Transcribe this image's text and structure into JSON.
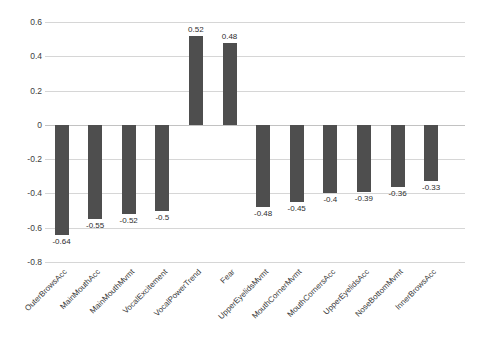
{
  "chart_data": {
    "type": "bar",
    "title": "",
    "subtitle": "",
    "xlabel": "",
    "ylabel": "",
    "ylim": [
      -0.8,
      0.6
    ],
    "yticks": [
      0.6,
      0.4,
      0.2,
      0,
      -0.2,
      -0.4,
      -0.6,
      -0.8
    ],
    "ytick_labels": [
      "0.6",
      "0.4",
      "0.2",
      "0",
      "-0.2",
      "-0.4",
      "-0.6",
      "-0.8"
    ],
    "grid": true,
    "legend": false,
    "legend_position": "none",
    "bar_color": "#4e4e4e",
    "orientation": "vertical",
    "categories": [
      "OuterBrowsAcc",
      "MainMouthAcc",
      "MainMouthMvmt",
      "VocalExcitement",
      "VocalPowerTrend",
      "Fear",
      "UpperEyelidsMvmt",
      "MouthCornerMvmt",
      "MouthCornersAcc",
      "UpperEyelidsAcc",
      "NoseBottomMvmt",
      "InnerBrowsAcc"
    ],
    "values": [
      -0.64,
      -0.55,
      -0.52,
      -0.5,
      0.52,
      0.48,
      -0.48,
      -0.45,
      -0.4,
      -0.39,
      -0.36,
      -0.33
    ],
    "value_labels": [
      "-0.64",
      "-0.55",
      "-0.52",
      "-0.5",
      "0.52",
      "0.48",
      "-0.48",
      "-0.45",
      "-0.4",
      "-0.39",
      "-0.36",
      "-0.33"
    ]
  }
}
